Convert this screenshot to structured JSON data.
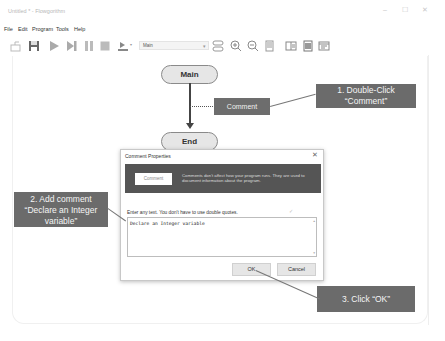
{
  "window": {
    "title": "Untitled * - Flowgorithm",
    "controls": {
      "minimize": "–",
      "maximize": "☐",
      "close": "✕"
    }
  },
  "menubar": {
    "items": [
      {
        "label": "File"
      },
      {
        "label": "Edit"
      },
      {
        "label": "Program"
      },
      {
        "label": "Tools"
      },
      {
        "label": "Help"
      }
    ]
  },
  "toolbar": {
    "icons": [
      "open-icon",
      "save-icon",
      "run-icon",
      "step-icon",
      "pause-icon",
      "stop-icon",
      "speed-icon",
      "layout-icon",
      "zoom-in-icon",
      "zoom-out-icon",
      "document-icon",
      "console-window-icon",
      "variable-window-icon",
      "source-window-icon"
    ],
    "function_dropdown": {
      "selected": "Main"
    }
  },
  "flowchart": {
    "nodes": [
      {
        "type": "start",
        "label": "Main"
      },
      {
        "type": "comment",
        "label": "Comment"
      },
      {
        "type": "end",
        "label": "End"
      }
    ]
  },
  "callouts": [
    {
      "step": 1,
      "text_line1": "1. Double-Click",
      "text_line2": "“Comment”"
    },
    {
      "step": 2,
      "text_line1": "2. Add comment",
      "text_line2": "“Declare an Integer",
      "text_line3": "variable”"
    },
    {
      "step": 3,
      "text_line1": "3. Click “OK”"
    }
  ],
  "dialog": {
    "title": "Comment Properties",
    "close_label": "✕",
    "banner_button": "Comment",
    "banner_text": "Comments don't affect how your program runs. They are used to document information about the program.",
    "prompt": "Enter any text. You don't have to use double quotes.",
    "hint_glyph": "✓",
    "textarea_value": "Declare an Integer variable",
    "ok_label": "OK",
    "cancel_label": "Cancel"
  },
  "colors": {
    "callout_bg": "#6b6b6b",
    "banner_bg": "#555555",
    "node_fill": "#e6e6e6",
    "comment_fill": "#6d6d6d"
  }
}
